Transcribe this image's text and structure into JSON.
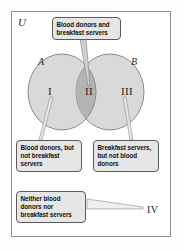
{
  "figure": {
    "type": "venn-diagram",
    "universe_label": "U",
    "sets": {
      "left": {
        "label": "A",
        "fill_color": "#d9d9d9",
        "stroke_color": "#8a8a8a"
      },
      "right": {
        "label": "B",
        "fill_color": "#d9d9d9",
        "stroke_color": "#8a8a8a"
      },
      "intersection_fill_color": "#b4b4b4"
    },
    "regions": [
      {
        "numeral": "I",
        "meaning": "Blood donors, but not breakfast servers"
      },
      {
        "numeral": "II",
        "meaning": "Blood donors and breakfast servers"
      },
      {
        "numeral": "III",
        "meaning": "Breakfast servers, but not blood donors"
      },
      {
        "numeral": "IV",
        "meaning": "Neither blood donors nor breakfast servers"
      }
    ],
    "callouts": {
      "intersection": "Blood donors and\nbreakfast servers",
      "only_a": "Blood donors, but\nnot breakfast\nservers",
      "only_b": "Breakfast servers,\nbut not blood\ndonors",
      "neither": "Neither blood\ndonors nor\nbreakfast servers"
    },
    "region_numerals": {
      "one": "I",
      "two": "II",
      "three": "III",
      "four": "IV"
    },
    "colors": {
      "border": "#8d8d8d",
      "callout_fill": "#e6e6e6",
      "callout_border": "#5b5b5b",
      "text": "#111111"
    }
  }
}
